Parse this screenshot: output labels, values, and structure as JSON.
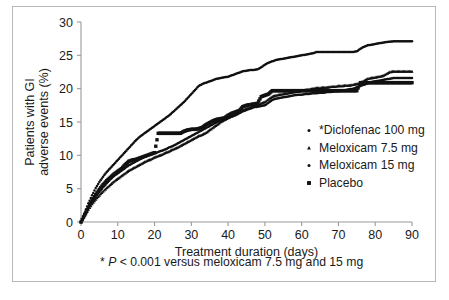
{
  "figure": {
    "border_color": "#b9b9b9",
    "background": "#ffffff",
    "ink_color": "#111111",
    "axis_color": "#9a9a9a"
  },
  "axes": {
    "x_title": "Treatment duration (days)",
    "y_title_line1": "Patients with GI",
    "y_title_line2": "adverse events (%)",
    "x_ticks": [
      "0",
      "10",
      "20",
      "30",
      "40",
      "50",
      "60",
      "70",
      "80",
      "90"
    ],
    "y_ticks": [
      "0",
      "5",
      "10",
      "15",
      "20",
      "25",
      "30"
    ]
  },
  "legend": {
    "items": [
      {
        "label": "*Diclofenac 100 mg",
        "marker": "dot",
        "key": "diclofenac"
      },
      {
        "label": "Meloxicam 7.5 mg",
        "marker": "triangle",
        "key": "meloxicam75"
      },
      {
        "label": "Meloxicam 15 mg",
        "marker": "dot",
        "key": "meloxicam15"
      },
      {
        "label": "Placebo",
        "marker": "square",
        "key": "placebo"
      }
    ]
  },
  "footnote": {
    "star": "*",
    "italic_p": "P",
    "rest": " < 0.001 versus meloxicam 7.5 mg and 15 mg",
    "full": "* P < 0.001 versus meloxicam 7.5 mg and 15 mg"
  },
  "chart_data": {
    "type": "line",
    "title": "",
    "xlabel": "Treatment duration (days)",
    "ylabel": "Patients with GI adverse events (%)",
    "xlim": [
      0,
      90
    ],
    "ylim": [
      0,
      30
    ],
    "xticks": [
      0,
      10,
      20,
      30,
      40,
      50,
      60,
      70,
      80,
      90
    ],
    "yticks": [
      0,
      5,
      10,
      15,
      20,
      25,
      30
    ],
    "grid": false,
    "legend_position": "right-inside",
    "marker_only": true,
    "annotation": "* P < 0.001 versus meloxicam 7.5 mg and 15 mg",
    "series": [
      {
        "name": "*Diclofenac 100 mg",
        "marker": "dot",
        "x": [
          0,
          1,
          2,
          3,
          4,
          5,
          6,
          7,
          8,
          9,
          10,
          11,
          12,
          13,
          14,
          15,
          16,
          17,
          18,
          19,
          20,
          21,
          22,
          23,
          24,
          25,
          26,
          27,
          28,
          29,
          30,
          31,
          32,
          33,
          34,
          35,
          36,
          37,
          38,
          39,
          40,
          41,
          42,
          43,
          44,
          45,
          46,
          47,
          48,
          49,
          50,
          51,
          52,
          53,
          54,
          55,
          56,
          57,
          58,
          59,
          60,
          61,
          62,
          63,
          64,
          65,
          66,
          67,
          68,
          69,
          70,
          71,
          72,
          73,
          74,
          75,
          76,
          77,
          78,
          79,
          80,
          81,
          82,
          83,
          84,
          85,
          86,
          87,
          88,
          89,
          90
        ],
        "y": [
          0.0,
          1.4,
          2.8,
          4.0,
          5.1,
          6.0,
          6.8,
          7.5,
          8.1,
          8.7,
          9.3,
          9.9,
          10.5,
          11.1,
          11.7,
          12.3,
          12.8,
          13.2,
          13.6,
          14.0,
          14.4,
          14.8,
          15.2,
          15.6,
          16.0,
          16.5,
          17.0,
          17.5,
          18.0,
          18.6,
          19.2,
          19.8,
          20.4,
          20.7,
          20.9,
          21.1,
          21.3,
          21.5,
          21.6,
          21.7,
          21.8,
          22.0,
          22.2,
          22.4,
          22.6,
          22.7,
          22.8,
          22.8,
          22.9,
          23.2,
          23.6,
          23.9,
          24.1,
          24.3,
          24.4,
          24.5,
          24.6,
          24.7,
          24.8,
          24.9,
          25.0,
          25.1,
          25.2,
          25.3,
          25.5,
          25.5,
          25.5,
          25.5,
          25.5,
          25.5,
          25.5,
          25.5,
          25.5,
          25.5,
          25.5,
          25.6,
          26.0,
          26.3,
          26.5,
          26.6,
          26.7,
          26.8,
          26.9,
          27.0,
          27.05,
          27.1,
          27.1,
          27.1,
          27.1,
          27.1,
          27.1
        ]
      },
      {
        "name": "Meloxicam 7.5 mg",
        "marker": "triangle",
        "x": [
          0,
          1,
          2,
          3,
          4,
          5,
          6,
          7,
          8,
          9,
          10,
          11,
          12,
          13,
          14,
          15,
          16,
          17,
          18,
          19,
          20,
          21,
          22,
          23,
          24,
          25,
          26,
          27,
          28,
          29,
          30,
          31,
          32,
          33,
          34,
          35,
          36,
          37,
          38,
          39,
          40,
          41,
          42,
          43,
          44,
          45,
          46,
          47,
          48,
          49,
          50,
          51,
          52,
          53,
          54,
          55,
          56,
          57,
          58,
          59,
          60,
          61,
          62,
          63,
          64,
          65,
          66,
          67,
          68,
          69,
          70,
          71,
          72,
          73,
          74,
          75,
          76,
          77,
          78,
          79,
          80,
          81,
          82,
          83,
          84,
          85,
          86,
          87,
          88,
          89,
          90
        ],
        "y": [
          0.0,
          0.9,
          1.9,
          2.7,
          3.4,
          4.0,
          4.6,
          5.1,
          5.6,
          6.1,
          6.5,
          6.9,
          7.3,
          7.7,
          8.0,
          8.3,
          8.6,
          8.9,
          9.2,
          9.4,
          9.7,
          9.9,
          10.1,
          10.4,
          10.6,
          10.9,
          11.1,
          11.4,
          11.7,
          12.0,
          12.3,
          12.6,
          12.9,
          13.1,
          13.4,
          13.8,
          14.2,
          14.6,
          15.0,
          15.3,
          15.6,
          15.9,
          16.2,
          16.5,
          16.8,
          17.0,
          17.2,
          17.4,
          17.6,
          17.8,
          18.0,
          18.4,
          18.8,
          19.0,
          19.1,
          19.2,
          19.3,
          19.4,
          19.5,
          19.6,
          19.7,
          19.8,
          19.9,
          20.0,
          20.1,
          20.1,
          20.2,
          20.2,
          20.3,
          20.3,
          20.4,
          20.4,
          20.5,
          20.5,
          20.6,
          20.7,
          20.9,
          21.2,
          21.5,
          21.6,
          21.7,
          21.8,
          21.9,
          22.2,
          22.5,
          22.6,
          22.6,
          22.6,
          22.6,
          22.6,
          22.6
        ]
      },
      {
        "name": "Meloxicam 15 mg",
        "marker": "dot",
        "x": [
          0,
          1,
          2,
          3,
          4,
          5,
          6,
          7,
          8,
          9,
          10,
          11,
          12,
          13,
          14,
          15,
          16,
          17,
          18,
          19,
          20,
          21,
          22,
          23,
          24,
          25,
          26,
          27,
          28,
          29,
          30,
          31,
          32,
          33,
          34,
          35,
          36,
          37,
          38,
          39,
          40,
          41,
          42,
          43,
          44,
          45,
          46,
          47,
          48,
          49,
          50,
          51,
          52,
          53,
          54,
          55,
          56,
          57,
          58,
          59,
          60,
          61,
          62,
          63,
          64,
          65,
          66,
          67,
          68,
          69,
          70,
          71,
          72,
          73,
          74,
          75,
          76,
          77,
          78,
          79,
          80,
          81,
          82,
          83,
          84,
          85,
          86,
          87,
          88,
          89,
          90
        ],
        "y": [
          0.0,
          1.0,
          2.1,
          3.0,
          3.8,
          4.5,
          5.2,
          5.8,
          6.4,
          6.9,
          7.3,
          7.7,
          8.1,
          8.5,
          8.8,
          9.1,
          9.4,
          9.7,
          9.9,
          10.1,
          10.3,
          10.5,
          10.7,
          10.9,
          11.2,
          11.4,
          11.7,
          12.0,
          12.3,
          12.6,
          12.9,
          13.2,
          13.5,
          13.8,
          14.1,
          14.4,
          14.7,
          15.0,
          15.2,
          15.4,
          15.6,
          15.8,
          16.0,
          16.3,
          16.6,
          16.8,
          17.0,
          17.2,
          17.3,
          17.4,
          17.5,
          17.9,
          18.3,
          18.5,
          18.6,
          18.7,
          18.8,
          18.9,
          19.0,
          19.1,
          19.1,
          19.2,
          19.2,
          19.3,
          19.3,
          19.4,
          19.4,
          19.5,
          19.5,
          19.6,
          19.6,
          19.7,
          19.8,
          19.9,
          20.0,
          20.2,
          20.4,
          20.6,
          20.8,
          21.0,
          21.1,
          21.2,
          21.3,
          21.4,
          21.5,
          21.6,
          21.6,
          21.6,
          21.6,
          21.6,
          21.6
        ]
      },
      {
        "name": "Placebo",
        "marker": "square",
        "x": [
          0,
          1,
          2,
          3,
          4,
          5,
          6,
          7,
          8,
          9,
          10,
          11,
          12,
          13,
          14,
          15,
          16,
          17,
          18,
          19,
          20,
          21,
          22,
          23,
          24,
          25,
          26,
          27,
          28,
          29,
          30,
          31,
          32,
          33,
          34,
          35,
          36,
          37,
          38,
          39,
          40,
          41,
          42,
          43,
          44,
          45,
          46,
          47,
          48,
          49,
          50,
          51,
          52,
          53,
          54,
          55,
          56,
          57,
          58,
          59,
          60,
          61,
          62,
          63,
          64,
          65,
          66,
          67,
          68,
          69,
          70,
          71,
          72,
          73,
          74,
          75,
          76,
          77,
          78,
          79,
          80,
          81,
          82,
          83,
          84,
          85,
          86,
          87,
          88,
          89,
          90
        ],
        "y": [
          0.0,
          1.1,
          2.2,
          3.2,
          4.1,
          4.9,
          5.6,
          6.2,
          6.7,
          7.2,
          7.6,
          8.0,
          8.6,
          9.1,
          9.3,
          9.4,
          9.6,
          9.8,
          10.0,
          10.2,
          10.4,
          13.3,
          13.3,
          13.3,
          13.3,
          13.3,
          13.3,
          13.3,
          13.6,
          13.8,
          13.9,
          13.9,
          14.0,
          14.2,
          14.6,
          14.9,
          15.2,
          15.4,
          15.5,
          15.6,
          16.0,
          16.3,
          16.5,
          16.7,
          17.3,
          17.5,
          17.6,
          17.7,
          17.8,
          18.8,
          19.0,
          19.2,
          19.7,
          19.7,
          19.7,
          19.7,
          19.7,
          19.7,
          19.7,
          19.7,
          19.7,
          19.7,
          19.7,
          19.7,
          19.7,
          19.7,
          19.7,
          19.7,
          19.7,
          19.7,
          19.7,
          19.7,
          19.7,
          19.7,
          19.7,
          19.7,
          20.9,
          20.9,
          20.9,
          20.9,
          20.9,
          20.9,
          20.9,
          20.9,
          20.9,
          20.9,
          20.9,
          20.9,
          20.9,
          20.9,
          20.9
        ]
      }
    ]
  }
}
